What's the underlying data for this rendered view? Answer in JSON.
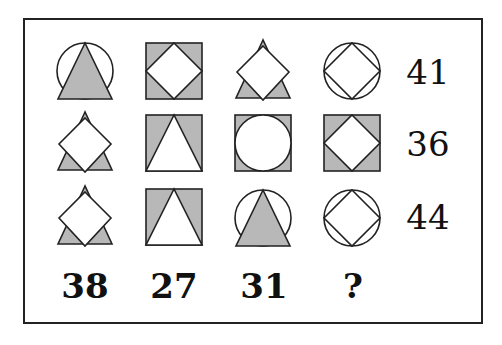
{
  "puzzle": {
    "grid": [
      [
        "circle-with-gray-triangle",
        "gray-square-with-white-diamond",
        "white-diamond-over-gray-triangle",
        "circle-with-inscribed-diamond"
      ],
      [
        "white-diamond-over-gray-triangle",
        "gray-square-with-white-triangle",
        "gray-square-with-white-circle",
        "gray-square-with-white-diamond"
      ],
      [
        "white-diamond-over-gray-triangle",
        "gray-square-with-white-triangle",
        "circle-with-gray-triangle",
        "circle-with-inscribed-diamond"
      ]
    ],
    "row_sums": [
      "41",
      "36",
      "44"
    ],
    "column_sums": [
      "38",
      "27",
      "31",
      "?"
    ],
    "colors": {
      "fill_gray": "#b8b8b8",
      "stroke": "#222222"
    }
  }
}
